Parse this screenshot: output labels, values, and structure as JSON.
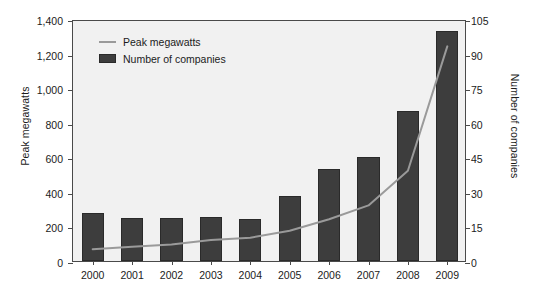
{
  "chart_data": {
    "type": "bar",
    "title": "",
    "subtitle": "",
    "categories": [
      "2000",
      "2001",
      "2002",
      "2003",
      "2004",
      "2005",
      "2006",
      "2007",
      "2008",
      "2009"
    ],
    "series": [
      {
        "name": "Number of companies",
        "type": "bar",
        "axis": "left",
        "units": "Peak megawatts",
        "values": [
          280,
          250,
          250,
          255,
          245,
          375,
          535,
          600,
          870,
          1330
        ]
      },
      {
        "name": "Peak megawatts",
        "type": "line",
        "axis": "right",
        "units": "Number of companies",
        "values": [
          6,
          7,
          8,
          10,
          11,
          14,
          19,
          25,
          40,
          94
        ]
      }
    ],
    "xlabel": "",
    "ylabel": "Peak megawatts",
    "y2label": "Number of companies",
    "ylim": [
      0,
      1400
    ],
    "y2lim": [
      0,
      105
    ],
    "yticks": [
      "0",
      "200",
      "400",
      "600",
      "800",
      "1,000",
      "1,200",
      "1,400"
    ],
    "ytick_values": [
      0,
      200,
      400,
      600,
      800,
      1000,
      1200,
      1400
    ],
    "y2ticks": [
      "0",
      "15",
      "30",
      "45",
      "60",
      "75",
      "90",
      "105"
    ],
    "y2tick_values": [
      0,
      15,
      30,
      45,
      60,
      75,
      90,
      105
    ],
    "grid": false,
    "legend_position": "top-left",
    "legend": [
      {
        "label": "Peak megawatts",
        "marker": "line",
        "color": "#9a9a9a"
      },
      {
        "label": "Number of companies",
        "marker": "box",
        "color": "#3d3d3d"
      }
    ]
  },
  "colors": {
    "plot_background": "#f1f1f1",
    "page_background": "#ffffff",
    "bar_fill": "#3d3d3d",
    "bar_stroke": "#2a2a2a",
    "line": "#9a9a9a",
    "axis": "#4a4a4a",
    "text": "#1b1b1b"
  }
}
